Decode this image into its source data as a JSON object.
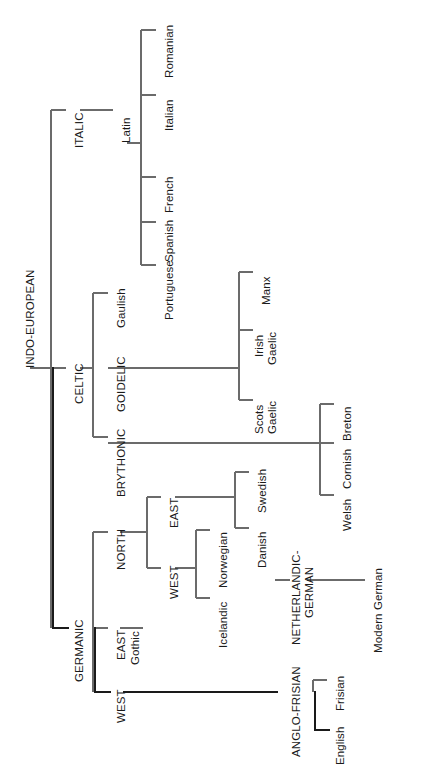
{
  "diagram": {
    "orientation": "rotated-90-counterclockwise",
    "line_color": "#6b6b6b",
    "bold_line_color": "#1a1a1a",
    "text_color": "#1a1a1a",
    "background": "#ffffff"
  },
  "nodes": {
    "root": "INDO-EUROPEAN",
    "italic": "ITALIC",
    "latin": "Latin",
    "romanian": "Romanian",
    "italian": "Italian",
    "french": "French",
    "spanish": "Spanish",
    "portuguese": "Portuguese",
    "celtic": "CELTIC",
    "gaulish": "Gaulish",
    "goidelic": "GOIDELIC",
    "manx": "Manx",
    "irish_gaelic_l1": "Irish",
    "irish_gaelic_l2": "Gaelic",
    "scots_gaelic_l1": "Scots",
    "scots_gaelic_l2": "Gaelic",
    "brythonic": "BRYTHONIC",
    "breton": "Breton",
    "cornish": "Cornish",
    "welsh": "Welsh",
    "germanic": "GERMANIC",
    "north": "NORTH",
    "north_east": "EAST",
    "swedish": "Swedish",
    "danish": "Danish",
    "north_west": "WEST",
    "norwegian": "Norwegian",
    "icelandic": "Icelandic",
    "germanic_east": "EAST",
    "gothic": "Gothic",
    "germanic_west": "WEST",
    "netherlandic_german_l1": "NETHERLANDIC-",
    "netherlandic_german_l2": "GERMAN",
    "modern_german": "Modern German",
    "anglo_frisian": "ANGLO-FRISIAN",
    "frisian": "Frisian",
    "english": "English"
  },
  "tree_structure": {
    "name": "INDO-EUROPEAN",
    "children": [
      {
        "name": "ITALIC",
        "children": [
          {
            "name": "Latin",
            "children": [
              {
                "name": "Romanian"
              },
              {
                "name": "Italian"
              },
              {
                "name": "French"
              },
              {
                "name": "Spanish"
              },
              {
                "name": "Portuguese"
              }
            ]
          }
        ]
      },
      {
        "name": "CELTIC",
        "children": [
          {
            "name": "Gaulish"
          },
          {
            "name": "GOIDELIC",
            "children": [
              {
                "name": "Manx"
              },
              {
                "name": "Irish Gaelic"
              },
              {
                "name": "Scots Gaelic"
              }
            ]
          },
          {
            "name": "BRYTHONIC",
            "children": [
              {
                "name": "Breton"
              },
              {
                "name": "Cornish"
              },
              {
                "name": "Welsh"
              }
            ]
          }
        ]
      },
      {
        "name": "GERMANIC",
        "highlighted": true,
        "children": [
          {
            "name": "NORTH",
            "children": [
              {
                "name": "EAST",
                "children": [
                  {
                    "name": "Swedish"
                  },
                  {
                    "name": "Danish"
                  }
                ]
              },
              {
                "name": "WEST",
                "children": [
                  {
                    "name": "Norwegian"
                  },
                  {
                    "name": "Icelandic"
                  }
                ]
              }
            ]
          },
          {
            "name": "EAST",
            "children": [
              {
                "name": "Gothic"
              }
            ]
          },
          {
            "name": "WEST",
            "highlighted": true,
            "children": [
              {
                "name": "NETHERLANDIC-GERMAN",
                "children": [
                  {
                    "name": "Modern German"
                  }
                ]
              },
              {
                "name": "ANGLO-FRISIAN",
                "highlighted": true,
                "children": [
                  {
                    "name": "Frisian"
                  },
                  {
                    "name": "English",
                    "highlighted": true
                  }
                ]
              }
            ]
          }
        ]
      }
    ]
  }
}
